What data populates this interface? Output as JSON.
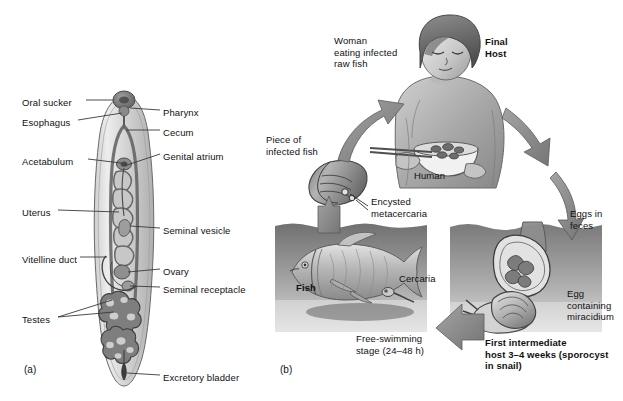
{
  "figure": {
    "panels": [
      {
        "id": "a",
        "caption": "(a)",
        "title": "Adult fluke internal anatomy",
        "x": 24,
        "y": 364
      },
      {
        "id": "b",
        "caption": "(b)",
        "title": "Life cycle of the Chinese liver fluke",
        "x": 280,
        "y": 364
      }
    ]
  },
  "panel_a": {
    "subject": "adult-digenean-fluke",
    "labels_left": [
      {
        "text": "Oral sucker",
        "x": 22,
        "y": 97,
        "leader_to_x": 112,
        "leader_to_y": 102
      },
      {
        "text": "Esophagus",
        "x": 22,
        "y": 117,
        "leader_to_x": 118,
        "leader_to_y": 122
      },
      {
        "text": "Acetabulum",
        "x": 22,
        "y": 156,
        "leader_to_x": 122,
        "leader_to_y": 161
      },
      {
        "text": "Uterus",
        "x": 22,
        "y": 207,
        "leader_to_x": 118,
        "leader_to_y": 212
      },
      {
        "text": "Vitelline duct",
        "x": 22,
        "y": 254,
        "leader_to_x": 110,
        "leader_to_y": 259
      },
      {
        "text": "Testes",
        "x": 22,
        "y": 314,
        "leader_to_x": 118,
        "leader_to_y": 300
      }
    ],
    "labels_right": [
      {
        "text": "Pharynx",
        "x": 163,
        "y": 107,
        "leader_to_x": 130,
        "leader_to_y": 106
      },
      {
        "text": "Cecum",
        "x": 163,
        "y": 127,
        "leader_to_x": 124,
        "leader_to_y": 131
      },
      {
        "text": "Genital atrium",
        "x": 163,
        "y": 151,
        "leader_to_x": 122,
        "leader_to_y": 168
      },
      {
        "text": "Seminal vesicle",
        "x": 163,
        "y": 225,
        "leader_to_x": 130,
        "leader_to_y": 229
      },
      {
        "text": "Ovary",
        "x": 163,
        "y": 266,
        "leader_to_x": 132,
        "leader_to_y": 271
      },
      {
        "text": "Seminal receptacle",
        "x": 163,
        "y": 284,
        "leader_to_x": 132,
        "leader_to_y": 288
      },
      {
        "text": "Excretory bladder",
        "x": 163,
        "y": 372,
        "leader_to_x": 128,
        "leader_to_y": 372
      }
    ]
  },
  "panel_b": {
    "subject": "fluke-life-cycle",
    "stage_labels": [
      {
        "name": "woman-eating-label",
        "text": "Woman\neating infected\nraw fish",
        "x": 334,
        "y": 35,
        "bold": false
      },
      {
        "name": "final-host-label",
        "text": "Final\nHost",
        "x": 485,
        "y": 36,
        "bold": true
      },
      {
        "name": "human-label",
        "text": "Human",
        "x": 414,
        "y": 170,
        "bold": false
      },
      {
        "name": "piece-of-fish-label",
        "text": "Piece of\ninfected fish",
        "x": 266,
        "y": 134,
        "bold": false
      },
      {
        "name": "encysted-metacercaria-label",
        "text": "Encysted\nmetacercaria",
        "x": 371,
        "y": 196,
        "bold": false
      },
      {
        "name": "fish-label",
        "text": "Fish",
        "x": 296,
        "y": 282,
        "bold": true
      },
      {
        "name": "cercaria-label",
        "text": "Cercaria",
        "x": 399,
        "y": 273,
        "bold": false
      },
      {
        "name": "free-swimming-label",
        "text": "Free-swimming\nstage (24–48 h)",
        "x": 356,
        "y": 333,
        "bold": false
      },
      {
        "name": "eggs-in-feces-label",
        "text": "Eggs in\nfeces",
        "x": 570,
        "y": 208,
        "bold": false
      },
      {
        "name": "egg-miracidium-label",
        "text": "Egg\ncontaining\nmiracidium",
        "x": 567,
        "y": 288,
        "bold": false
      },
      {
        "name": "first-intermediate-host-label",
        "text": "First intermediate\nhost 3–4 weeks (sporocyst\nin snail)",
        "x": 485,
        "y": 337,
        "bold": true
      }
    ],
    "underwater_panels": [
      {
        "name": "fish-water-panel",
        "x": 275,
        "y": 222,
        "w": 152,
        "h": 110
      },
      {
        "name": "snail-water-panel",
        "x": 450,
        "y": 222,
        "w": 152,
        "h": 110
      }
    ],
    "arrows": [
      {
        "name": "arrow-fish-to-mouth",
        "from": "piece of fish",
        "to": "woman"
      },
      {
        "name": "arrow-woman-to-feces",
        "from": "woman",
        "to": "eggs in feces"
      },
      {
        "name": "arrow-feces-to-snail",
        "from": "eggs",
        "to": "snail"
      },
      {
        "name": "arrow-snail-to-fish",
        "from": "snail",
        "to": "free-swimming cercaria"
      },
      {
        "name": "arrow-fish-up",
        "from": "fish",
        "to": "piece of infected fish"
      }
    ]
  },
  "colors": {
    "ink": "#111111",
    "water_dark": "#6e6e6e",
    "water_light": "#bdbdbd",
    "tissue_mid": "#9a9a9a",
    "tissue_dark": "#5a5a5a",
    "arrow_fill": "#8c8c8c",
    "background": "#ffffff"
  }
}
